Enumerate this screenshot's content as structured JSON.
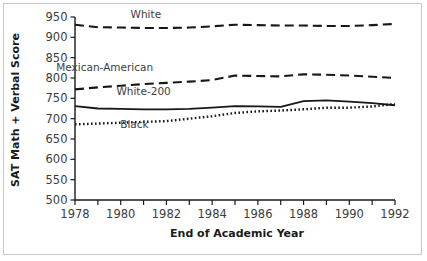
{
  "figure": {
    "background_color": "#ffffff",
    "frame_color": "#c9c9c9",
    "ink_color": "#17171a"
  },
  "labels": {
    "ylabel": "SAT Math + Verbal Score",
    "xlabel": "End of Academic Year",
    "white": "White",
    "mexican_american": "Mexican-American",
    "white_minus_200": "White-200",
    "black": "Black"
  },
  "chart_data": {
    "type": "line",
    "title": "",
    "xlabel": "End of Academic Year",
    "ylabel": "SAT Math + Verbal Score",
    "xlim": [
      1978,
      1992
    ],
    "ylim": [
      500,
      950
    ],
    "yticks": [
      500,
      550,
      600,
      650,
      700,
      750,
      800,
      850,
      900,
      950
    ],
    "ytick_labels": [
      "500",
      "550",
      "600",
      "650",
      "700",
      "750",
      "800",
      "850",
      "900",
      "950"
    ],
    "xticks": [
      1978,
      1979,
      1980,
      1981,
      1982,
      1983,
      1984,
      1985,
      1986,
      1987,
      1988,
      1989,
      1990,
      1991,
      1992
    ],
    "xtick_labels_shown": [
      "1978",
      "1980",
      "1982",
      "1984",
      "1986",
      "1988",
      "1990",
      "1992"
    ],
    "grid": false,
    "legend": "inline-annotations",
    "x": [
      1978,
      1979,
      1980,
      1981,
      1982,
      1983,
      1984,
      1985,
      1986,
      1987,
      1988,
      1989,
      1990,
      1991,
      1992
    ],
    "series": [
      {
        "name": "White",
        "style": "dashed",
        "label_x": 1981.1,
        "label_y": 948,
        "values": [
          931,
          925,
          924,
          923,
          923,
          924,
          927,
          931,
          930,
          929,
          929,
          928,
          928,
          930,
          933
        ]
      },
      {
        "name": "Mexican-American",
        "style": "dashed",
        "label_x": 1979.3,
        "label_y": 818,
        "values": [
          772,
          777,
          781,
          785,
          788,
          791,
          795,
          806,
          805,
          804,
          809,
          808,
          806,
          803,
          800
        ]
      },
      {
        "name": "White-200",
        "style": "solid",
        "label_x": 1981.0,
        "label_y": 757,
        "values": [
          731,
          725,
          724,
          723,
          723,
          724,
          727,
          731,
          730,
          729,
          743,
          745,
          742,
          738,
          733
        ]
      },
      {
        "name": "Black",
        "style": "dotted",
        "label_x": 1980.6,
        "label_y": 676,
        "values": [
          686,
          688,
          690,
          692,
          694,
          700,
          706,
          714,
          718,
          720,
          723,
          727,
          727,
          730,
          736
        ]
      }
    ]
  }
}
